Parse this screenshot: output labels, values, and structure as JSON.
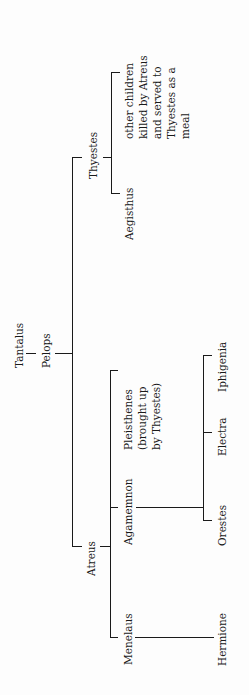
{
  "diagram": {
    "type": "family-tree",
    "orientation": "rotated-90-ccw",
    "nodes": {
      "tantalus": "Tantalus",
      "pelops": "Pelops",
      "thyestes": "Thyestes",
      "atreus": "Atreus",
      "other_children": [
        "other children",
        "killed by Atreus",
        "and served to",
        "Thyestes as a",
        "meal"
      ],
      "aegisthus": "Aegisthus",
      "pleisthenes": [
        "Pleisthenes",
        "(brought up",
        "by Thyestes)"
      ],
      "agamemnon": "Agamemnon",
      "menelaus": "Menelaus",
      "iphigenia": "Iphigenia",
      "electra": "Electra",
      "orestes": "Orestes",
      "hermione": "Hermione"
    },
    "edges": [
      [
        "Tantalus",
        "Pelops"
      ],
      [
        "Pelops",
        "Thyestes"
      ],
      [
        "Pelops",
        "Atreus"
      ],
      [
        "Thyestes",
        "other children killed by Atreus and served to Thyestes as a meal"
      ],
      [
        "Thyestes",
        "Aegisthus"
      ],
      [
        "Atreus",
        "Pleisthenes (brought up by Thyestes)"
      ],
      [
        "Atreus",
        "Agamemnon"
      ],
      [
        "Atreus",
        "Menelaus"
      ],
      [
        "Agamemnon",
        "Iphigenia"
      ],
      [
        "Agamemnon",
        "Electra"
      ],
      [
        "Agamemnon",
        "Orestes"
      ],
      [
        "Menelaus",
        "Hermione"
      ]
    ]
  }
}
